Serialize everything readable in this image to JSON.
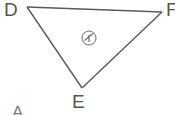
{
  "figure": {
    "type": "triangle",
    "stroke_color": "#5a5a5a",
    "background_color": "#ffffff",
    "vertices": [
      {
        "name": "D",
        "label": "D",
        "x": 27,
        "y": 7
      },
      {
        "name": "F",
        "label": "F",
        "x": 162,
        "y": 12
      },
      {
        "name": "E",
        "label": "E",
        "x": 82,
        "y": 88
      }
    ],
    "edges": [
      {
        "name": "edge-DF",
        "from": "D",
        "to": "F"
      },
      {
        "name": "edge-FE",
        "from": "F",
        "to": "E"
      },
      {
        "name": "edge-ED",
        "from": "E",
        "to": "D"
      }
    ],
    "angle_marker": {
      "label": "1",
      "cx": 89,
      "cy": 38,
      "r": 7
    },
    "extra_labels": [
      {
        "name": "partial-label-A",
        "label": "A",
        "x": 12,
        "y": 103
      }
    ]
  }
}
